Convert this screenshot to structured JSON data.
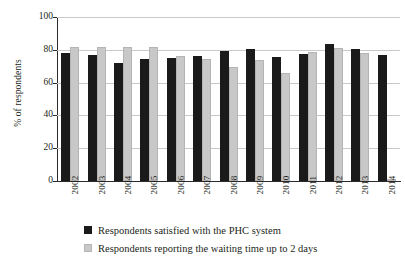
{
  "chart_data": {
    "type": "bar",
    "title": "",
    "xlabel": "",
    "ylabel": "% of respondents",
    "ylim": [
      0,
      100
    ],
    "yticks": [
      0,
      20,
      40,
      60,
      80,
      100
    ],
    "grid": true,
    "legend_position": "bottom",
    "categories": [
      "2002",
      "2003",
      "2004",
      "2005",
      "2006",
      "2007",
      "2008",
      "2009",
      "2010",
      "2011",
      "2012",
      "2013",
      "2014"
    ],
    "series": [
      {
        "name": "Respondents satisfied with the PHC system",
        "color": "#1a1a1a",
        "values": [
          78,
          77,
          72,
          74.5,
          75,
          76.5,
          79.5,
          80.5,
          75.5,
          77.5,
          83.5,
          80.5,
          77
        ]
      },
      {
        "name": "Respondents reporting the waiting time up to 2 days",
        "color": "#c8c8c8",
        "values": [
          82,
          81.5,
          81.5,
          81.5,
          76.5,
          74.5,
          69.5,
          73.5,
          66,
          78.5,
          81,
          78,
          null
        ]
      }
    ]
  },
  "axis": {
    "y_tick_labels": [
      "100",
      "80",
      "60",
      "40",
      "20",
      "0"
    ]
  }
}
